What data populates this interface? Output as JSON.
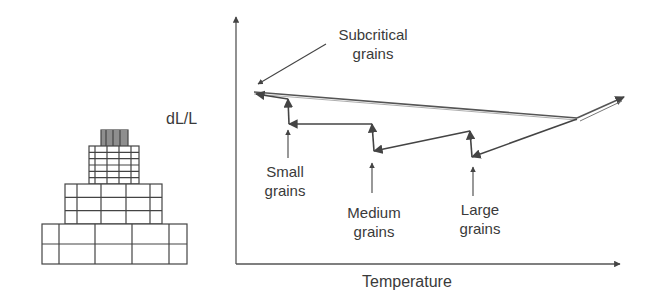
{
  "diagram": {
    "y_axis_label": "dL/L",
    "x_axis_label": "Temperature",
    "annotations": {
      "subcritical": [
        "Subcritical",
        "grains"
      ],
      "small": [
        "Small",
        "grains"
      ],
      "medium": [
        "Medium",
        "grains"
      ],
      "large": [
        "Large",
        "grains"
      ]
    },
    "pyramid": {
      "tiers": [
        {
          "name": "top-tier",
          "x": 101,
          "y": 130,
          "w": 27,
          "h": 16,
          "rows": 8,
          "cols": [
            101,
            106,
            113,
            120,
            128
          ]
        },
        {
          "name": "tier-2",
          "x": 89,
          "y": 146,
          "w": 50,
          "h": 38,
          "rows": 6,
          "cols": [
            89,
            95,
            107,
            119,
            131,
            139
          ]
        },
        {
          "name": "tier-3",
          "x": 65,
          "y": 184,
          "w": 97,
          "h": 40,
          "rows": 3,
          "cols": [
            65,
            77,
            101,
            126,
            150,
            162
          ]
        },
        {
          "name": "tier-4",
          "x": 42,
          "y": 224,
          "w": 145,
          "h": 40,
          "rows": 2,
          "cols": [
            42,
            59,
            95,
            132,
            169,
            187
          ]
        }
      ]
    },
    "colors": {
      "line": "#555555",
      "text": "#3a3a3a"
    }
  }
}
